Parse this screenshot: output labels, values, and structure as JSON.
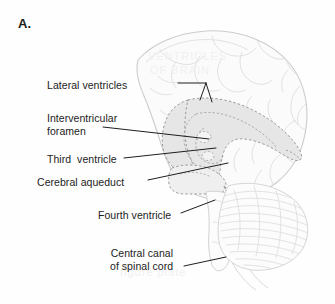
{
  "figure": {
    "panel_letter": "A.",
    "title_alt": "Ventricles of the brain — midsagittal view",
    "background_color": "#fefefe",
    "ink_color": "#1c1c1c",
    "outline_color": "#cfcfcf",
    "ventricle_fill": "#e3e3e3",
    "ventricle_dash_color": "#9a9a9a",
    "cerebellum_line_color": "#dcdcdc"
  },
  "labels": [
    {
      "id": "lateral-ventricles",
      "text": "Lateral ventricles",
      "x": 47,
      "y": 79,
      "align": "left"
    },
    {
      "id": "interventricular-foramen",
      "text": "Interventricular\nforamen",
      "x": 47,
      "y": 112,
      "align": "left"
    },
    {
      "id": "third-ventricle",
      "text": "Third  ventricle",
      "x": 47,
      "y": 153,
      "align": "left"
    },
    {
      "id": "cerebral-aqueduct",
      "text": "Cerebral aqueduct",
      "x": 37,
      "y": 176,
      "align": "left"
    },
    {
      "id": "fourth-ventricle",
      "text": "Fourth ventricle",
      "x": 98,
      "y": 209,
      "align": "left"
    },
    {
      "id": "central-canal-of-spinal-cord",
      "text": "Central canal\nof spinal cord",
      "x": 110,
      "y": 254,
      "align": "right"
    }
  ],
  "leader_lines": [
    {
      "id": "leader-lateral-ventricles",
      "points": "178,83 206,83 206,86 200,99 206,86 212,101"
    },
    {
      "id": "leader-interventricular-foramen",
      "points": "103,127 209,139"
    },
    {
      "id": "leader-third-ventricle",
      "points": "124,158 216,148"
    },
    {
      "id": "leader-cerebral-aqueduct",
      "points": "148,180 228,164"
    },
    {
      "id": "leader-fourth-ventricle",
      "points": "181,213 214,201"
    },
    {
      "id": "leader-central-canal",
      "points": "184,266 224,258"
    }
  ],
  "ghost_text": [
    {
      "id": "ghost-1",
      "text": "VENTRICLES",
      "x": 148,
      "y": 58
    },
    {
      "id": "ghost-2",
      "text": "OF BRAIN",
      "x": 150,
      "y": 72
    },
    {
      "id": "ghost-3",
      "text": "figure plate",
      "x": 120,
      "y": 272
    }
  ],
  "anatomy_parts": [
    {
      "id": "cerebrum-outline",
      "name": "cerebrum"
    },
    {
      "id": "lateral-ventricle-shape",
      "name": "lateral ventricle"
    },
    {
      "id": "third-ventricle-shape",
      "name": "third ventricle"
    },
    {
      "id": "cerebral-aqueduct-shape",
      "name": "cerebral aqueduct"
    },
    {
      "id": "fourth-ventricle-shape",
      "name": "fourth ventricle"
    },
    {
      "id": "central-canal-shape",
      "name": "central canal"
    },
    {
      "id": "cerebellum-shape",
      "name": "cerebellum"
    },
    {
      "id": "brainstem-shape",
      "name": "brainstem"
    },
    {
      "id": "spinal-cord-shape",
      "name": "spinal cord"
    }
  ]
}
